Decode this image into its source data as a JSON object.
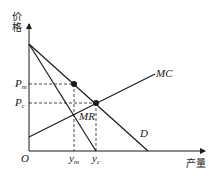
{
  "diagram": {
    "axes": {
      "y_label": "价格",
      "x_label": "产量",
      "origin_label": "O"
    },
    "curves": {
      "mc": "MC",
      "mr": "MR",
      "d": "D"
    },
    "prices": {
      "pm": "P",
      "pm_sub": "m",
      "pc": "P",
      "pc_sub": "c"
    },
    "quantities": {
      "ym": "y",
      "ym_sub": "m",
      "yc": "y",
      "yc_sub": "c"
    },
    "colors": {
      "line": "#1a1a1a",
      "background": "#ffffff"
    }
  }
}
